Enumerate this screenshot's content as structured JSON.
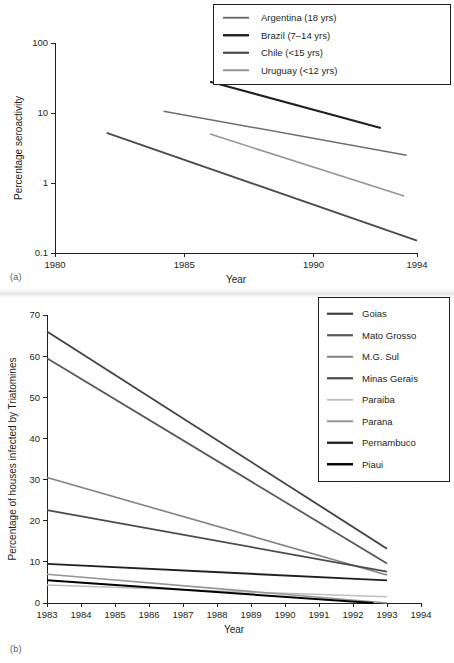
{
  "figure": {
    "panel_a_label": "(a)",
    "panel_b_label": "(b)"
  },
  "chart_data": [
    {
      "id": "panel-a",
      "type": "line",
      "title": "",
      "xlabel": "Year",
      "ylabel": "Percentage seroactivity",
      "yscale": "log",
      "ylim": [
        0.1,
        100
      ],
      "xlim": [
        1980,
        1994
      ],
      "xticks": [
        1980,
        1985,
        1990,
        1994
      ],
      "xtick_labels": [
        "1980",
        "1985",
        "1990",
        "1994"
      ],
      "yticks": [
        0.1,
        1,
        10,
        100
      ],
      "ytick_labels": [
        "0.1",
        "1",
        "10",
        "100"
      ],
      "grid": false,
      "legend_position": "top-right",
      "series": [
        {
          "name": "Argentina (18 yrs)",
          "color": "#6d6e71",
          "width": 1.5,
          "x": [
            1984.2,
            1993.6
          ],
          "y": [
            10.6,
            2.5
          ]
        },
        {
          "name": "Brazil (7–14 yrs)",
          "color": "#231f20",
          "width": 2.0,
          "x": [
            1986.0,
            1992.6
          ],
          "y": [
            28.0,
            6.1
          ]
        },
        {
          "name": "Chile (<15 yrs)",
          "color": "#4a4b4d",
          "width": 1.8,
          "x": [
            1982.0,
            1994.0
          ],
          "y": [
            5.2,
            0.15
          ]
        },
        {
          "name": "Uruguay (<12 yrs)",
          "color": "#939598",
          "width": 1.6,
          "x": [
            1986.0,
            1993.5
          ],
          "y": [
            5.0,
            0.65
          ]
        }
      ]
    },
    {
      "id": "panel-b",
      "type": "line",
      "title": "",
      "xlabel": "Year",
      "ylabel": "Percentage of houses infected by Triatomines",
      "yscale": "linear",
      "ylim": [
        0,
        70
      ],
      "xlim": [
        1983,
        1994
      ],
      "xticks": [
        1983,
        1984,
        1985,
        1986,
        1987,
        1988,
        1989,
        1990,
        1991,
        1992,
        1993,
        1994
      ],
      "xtick_labels": [
        "1983",
        "1984",
        "1985",
        "1986",
        "1987",
        "1988",
        "1989",
        "1990",
        "1991",
        "1992",
        "1993",
        "1994"
      ],
      "yticks": [
        0,
        10,
        20,
        30,
        40,
        50,
        60,
        70
      ],
      "ytick_labels": [
        "0",
        "10",
        "20",
        "30",
        "40",
        "50",
        "60",
        "70"
      ],
      "grid": false,
      "legend_position": "top-right",
      "series": [
        {
          "name": "Goias",
          "color": "#414042",
          "width": 1.8,
          "x": [
            1983,
            1993
          ],
          "y": [
            66.0,
            13.2
          ]
        },
        {
          "name": "Mato Grosso",
          "color": "#58595b",
          "width": 1.8,
          "x": [
            1983,
            1993
          ],
          "y": [
            59.5,
            9.6
          ]
        },
        {
          "name": "M.G. Sul",
          "color": "#808285",
          "width": 1.6,
          "x": [
            1983,
            1993
          ],
          "y": [
            30.5,
            6.8
          ]
        },
        {
          "name": "Minas Gerais",
          "color": "#4a4b4d",
          "width": 1.8,
          "x": [
            1983,
            1993
          ],
          "y": [
            22.6,
            7.6
          ]
        },
        {
          "name": "Paraiba",
          "color": "#bcbec0",
          "width": 1.5,
          "x": [
            1983,
            1993
          ],
          "y": [
            4.4,
            1.5
          ]
        },
        {
          "name": "Parana",
          "color": "#939598",
          "width": 1.6,
          "x": [
            1983,
            1993
          ],
          "y": [
            7.0,
            0.0
          ]
        },
        {
          "name": "Pernambuco",
          "color": "#231f20",
          "width": 1.9,
          "x": [
            1983,
            1993
          ],
          "y": [
            9.5,
            5.5
          ]
        },
        {
          "name": "Piaui",
          "color": "#000000",
          "width": 2.0,
          "x": [
            1983,
            1992.6
          ],
          "y": [
            5.5,
            0.0
          ]
        }
      ]
    }
  ]
}
